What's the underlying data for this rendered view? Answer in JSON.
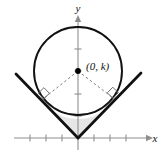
{
  "figure": {
    "background_color": "#ffffff",
    "width": 164,
    "height": 155,
    "axes": {
      "x_axis": {
        "label": "x",
        "color": "#8a8a8a",
        "origin_x": 78,
        "y_position": 138,
        "start_x": 14,
        "end_x": 150,
        "arrow": "right",
        "tick_length": 7,
        "tick_spacing": 16,
        "ticks_left": 3,
        "ticks_right": 3,
        "tick_labels": []
      },
      "y_axis": {
        "label": "y",
        "color": "#8a8a8a",
        "x_position": 78,
        "start_y": 16,
        "end_y": 150,
        "arrow": "up",
        "tick_length": 7,
        "tick_spacing": 22,
        "ticks_above_origin": 5,
        "tick_labels": []
      }
    },
    "circle": {
      "center_x": 78,
      "center_y": 71,
      "radius": 44,
      "stroke_color": "#000000",
      "stroke_width": 1.8,
      "fill": "none"
    },
    "center_point": {
      "label": "(0, k)",
      "x": 78,
      "y": 71,
      "marker": "filled-dot",
      "marker_radius": 2.8,
      "color": "#000000",
      "label_offset_x": 7,
      "label_offset_y": -2
    },
    "angle_rays": {
      "vertex_x": 78,
      "vertex_y": 138,
      "left_end_x": 16,
      "left_end_y": 74,
      "right_end_x": 141,
      "right_end_y": 73,
      "stroke_color": "#000000",
      "stroke_width": 2.6
    },
    "radii": {
      "stroke_color": "#7d7d7d",
      "stroke_width": 1,
      "dash": "2.5,2.5",
      "left_tangent_x": 43.5,
      "left_tangent_y": 98.5,
      "right_tangent_x": 113,
      "right_tangent_y": 98
    },
    "right_angle_marks": [
      {
        "name": "left-right-angle",
        "x": 43.5,
        "y": 98.5,
        "size": 8
      },
      {
        "name": "right-right-angle",
        "x": 113,
        "y": 98,
        "size": 8
      }
    ],
    "shaded_region": {
      "fill": "#e2e2e2",
      "opacity": 0.85,
      "description": "region between the V vertex and the lower circle arc"
    }
  }
}
